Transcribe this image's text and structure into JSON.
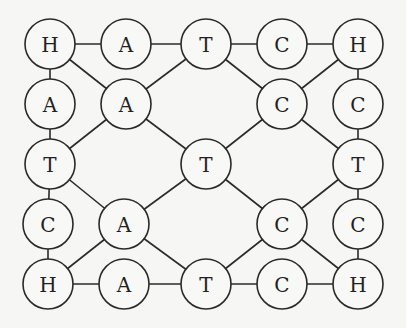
{
  "diagram": {
    "radius": 25,
    "nodes": [
      {
        "id": "n1",
        "label": "H",
        "x": 50,
        "y": 44
      },
      {
        "id": "n2",
        "label": "A",
        "x": 126,
        "y": 44
      },
      {
        "id": "n3",
        "label": "T",
        "x": 206,
        "y": 44
      },
      {
        "id": "n4",
        "label": "C",
        "x": 282,
        "y": 44
      },
      {
        "id": "n5",
        "label": "H",
        "x": 358,
        "y": 44
      },
      {
        "id": "n6",
        "label": "A",
        "x": 50,
        "y": 104
      },
      {
        "id": "n7",
        "label": "A",
        "x": 126,
        "y": 104
      },
      {
        "id": "n8",
        "label": "C",
        "x": 282,
        "y": 104
      },
      {
        "id": "n9",
        "label": "C",
        "x": 358,
        "y": 104
      },
      {
        "id": "n10",
        "label": "T",
        "x": 50,
        "y": 164
      },
      {
        "id": "n11",
        "label": "T",
        "x": 206,
        "y": 164
      },
      {
        "id": "n12",
        "label": "T",
        "x": 358,
        "y": 164
      },
      {
        "id": "n13",
        "label": "C",
        "x": 48,
        "y": 224
      },
      {
        "id": "n14",
        "label": "A",
        "x": 124,
        "y": 224
      },
      {
        "id": "n15",
        "label": "C",
        "x": 282,
        "y": 224
      },
      {
        "id": "n16",
        "label": "C",
        "x": 358,
        "y": 224
      },
      {
        "id": "n17",
        "label": "H",
        "x": 48,
        "y": 284
      },
      {
        "id": "n18",
        "label": "A",
        "x": 124,
        "y": 284
      },
      {
        "id": "n19",
        "label": "T",
        "x": 206,
        "y": 284
      },
      {
        "id": "n20",
        "label": "C",
        "x": 282,
        "y": 284
      },
      {
        "id": "n21",
        "label": "H",
        "x": 358,
        "y": 284
      }
    ],
    "edges": [
      [
        "n1",
        "n2"
      ],
      [
        "n2",
        "n3"
      ],
      [
        "n3",
        "n4"
      ],
      [
        "n4",
        "n5"
      ],
      [
        "n1",
        "n6"
      ],
      [
        "n6",
        "n10"
      ],
      [
        "n10",
        "n13"
      ],
      [
        "n13",
        "n17"
      ],
      [
        "n5",
        "n9"
      ],
      [
        "n9",
        "n12"
      ],
      [
        "n12",
        "n16"
      ],
      [
        "n16",
        "n21"
      ],
      [
        "n17",
        "n18"
      ],
      [
        "n18",
        "n19"
      ],
      [
        "n19",
        "n20"
      ],
      [
        "n20",
        "n21"
      ],
      [
        "n1",
        "n7"
      ],
      [
        "n7",
        "n3"
      ],
      [
        "n7",
        "n10"
      ],
      [
        "n7",
        "n11"
      ],
      [
        "n3",
        "n8"
      ],
      [
        "n5",
        "n8"
      ],
      [
        "n8",
        "n11"
      ],
      [
        "n8",
        "n12"
      ],
      [
        "n10",
        "n14"
      ],
      [
        "n11",
        "n14"
      ],
      [
        "n14",
        "n17"
      ],
      [
        "n14",
        "n19"
      ],
      [
        "n11",
        "n15"
      ],
      [
        "n12",
        "n15"
      ],
      [
        "n15",
        "n19"
      ],
      [
        "n15",
        "n21"
      ]
    ]
  }
}
